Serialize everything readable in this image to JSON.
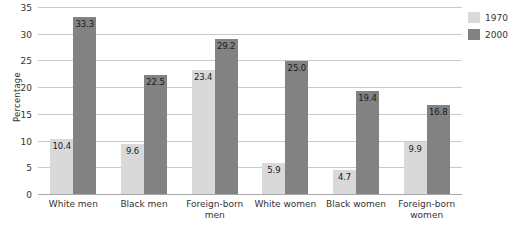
{
  "chart_data": {
    "type": "bar",
    "title": "",
    "xlabel": "",
    "ylabel": "Percentage",
    "ylim": [
      0,
      35
    ],
    "yticks": [
      0,
      5,
      10,
      15,
      20,
      25,
      30,
      35
    ],
    "grid": true,
    "legend_position": "right",
    "categories": [
      "White men",
      "Black men",
      "Foreign-born men",
      "White women",
      "Black women",
      "Foreign-born women"
    ],
    "category_lines": [
      [
        "White men"
      ],
      [
        "Black men"
      ],
      [
        "Foreign-born",
        "men"
      ],
      [
        "White women"
      ],
      [
        "Black women"
      ],
      [
        "Foreign-born",
        "women"
      ]
    ],
    "series": [
      {
        "name": "1970",
        "color": "#d9d9d9",
        "values": [
          10.4,
          9.6,
          23.4,
          5.9,
          4.7,
          9.9
        ],
        "labels": [
          "10.4",
          "9.6",
          "23.4",
          "5.9",
          "4.7",
          "9.9"
        ]
      },
      {
        "name": "2000",
        "color": "#828282",
        "values": [
          33.3,
          22.5,
          29.2,
          25.0,
          19.4,
          16.8
        ],
        "labels": [
          "33.3",
          "22.5",
          "29.2",
          "25.0",
          "19.4",
          "16.8"
        ]
      }
    ]
  },
  "legend": {
    "items": [
      {
        "label": "1970",
        "color": "#d9d9d9"
      },
      {
        "label": "2000",
        "color": "#828282"
      }
    ]
  },
  "colors": {
    "series_1970": "#d9d9d9",
    "series_2000": "#828282",
    "gridline": "#c9c9c9",
    "axis": "#a8a8a8",
    "text": "#333333",
    "background": "#ffffff"
  }
}
